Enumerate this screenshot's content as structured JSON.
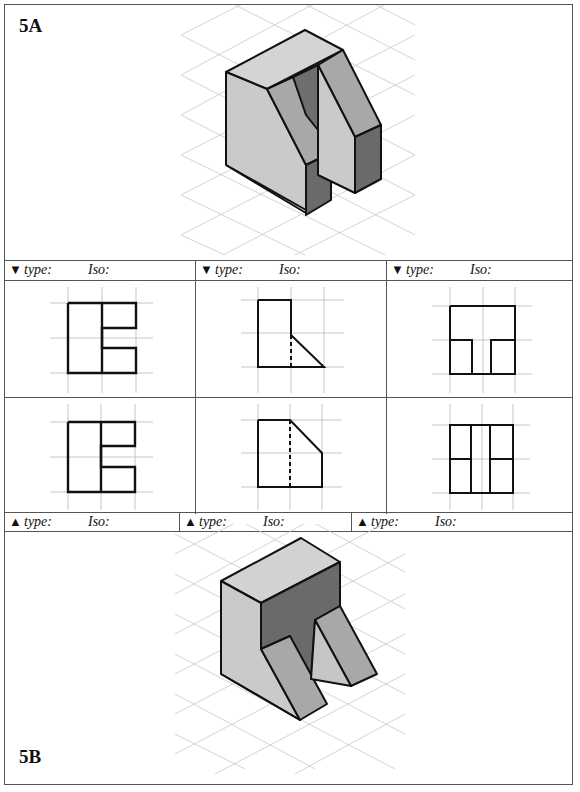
{
  "problem_a": {
    "label": "5A",
    "figure": "isometric-object-with-slanted-faces-and-vertical-slot"
  },
  "problem_b": {
    "label": "5B",
    "figure": "isometric-object-with-recessed-dark-face-and-two-sloped-legs"
  },
  "top_labels": [
    {
      "arrow": "▼",
      "type_label": "type:",
      "iso_label": "Iso:"
    },
    {
      "arrow": "▼",
      "type_label": "type:",
      "iso_label": "Iso:"
    },
    {
      "arrow": "▼",
      "type_label": "type:",
      "iso_label": "Iso:"
    }
  ],
  "bottom_labels": [
    {
      "arrow": "▲",
      "type_label": "type:",
      "iso_label": "Iso:"
    },
    {
      "arrow": "▲",
      "type_label": "type:",
      "iso_label": "Iso:"
    },
    {
      "arrow": "▲",
      "type_label": "type:",
      "iso_label": "Iso:"
    }
  ],
  "views": {
    "row1": [
      "rect-with-two-notches-right",
      "profile-with-slope-and-hidden-line",
      "rect-with-bottom-slot"
    ],
    "row2": [
      "rect-with-two-notches-right",
      "profile-with-top-chamfer-and-hidden-line",
      "rect-divided-into-six-cells"
    ]
  },
  "colors": {
    "border": "#555555",
    "grid": "#b8b8b8",
    "face_light": "#cfcfcf",
    "face_mid": "#a9a9a9",
    "face_dark": "#6e6e6e",
    "outline": "#111111"
  }
}
